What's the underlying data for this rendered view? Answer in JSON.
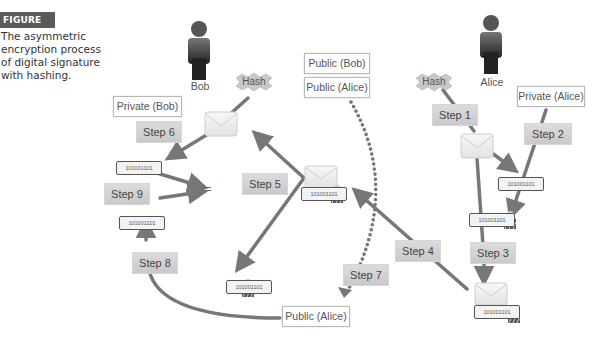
{
  "figure": {
    "label": "FIGURE 3-12",
    "caption": "The asymmetric encryption process of digital signature with hashing."
  },
  "actors": {
    "bob": "Bob",
    "alice": "Alice"
  },
  "hash_labels": {
    "left": "Hash",
    "right": "Hash"
  },
  "keys": {
    "private_bob": "Private (Bob)",
    "public_bob": "Public (Bob)",
    "public_alice_top": "Public (Alice)",
    "private_alice": "Private (Alice)",
    "public_alice_bottom": "Public (Alice)"
  },
  "steps": [
    "Step 1",
    "Step 2",
    "Step 3",
    "Step 4",
    "Step 5",
    "Step 6",
    "Step 7",
    "Step 8",
    "Step 9"
  ],
  "hash_value": "101001101",
  "compare_symbol": "?=",
  "colors": {
    "arrow": "#777777",
    "step_fill": "#d2d2d2",
    "figure_label_bg": "#5a5a5a"
  }
}
